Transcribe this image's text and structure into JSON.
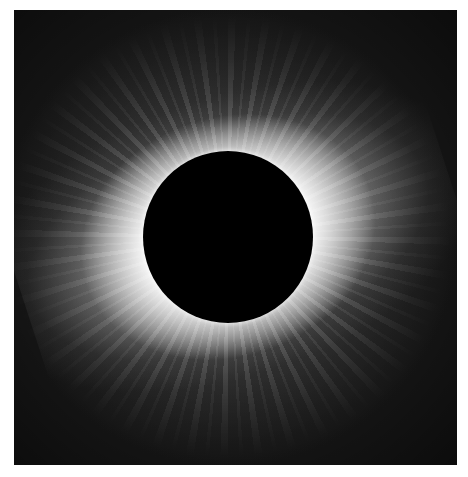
{
  "image": {
    "subject": "total-solar-eclipse-corona",
    "colors": {
      "background": "#1a1a1a",
      "moon": "#000000",
      "corona": "#ffffff",
      "border": "#ffffff"
    }
  }
}
